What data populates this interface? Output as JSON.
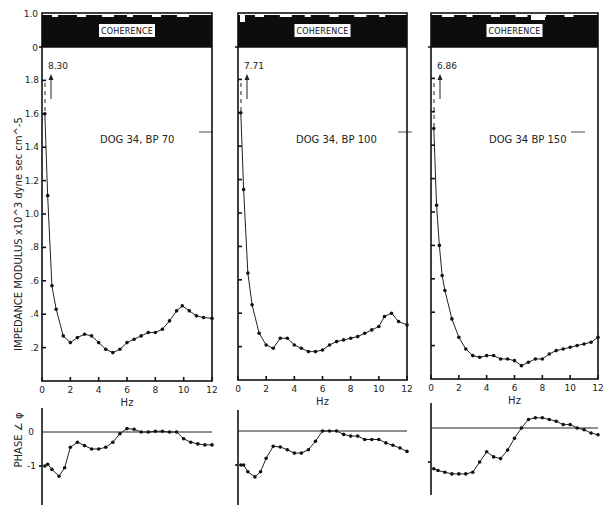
{
  "chart_data": [
    {
      "type": "line",
      "panel": "left",
      "title": "DOG 34, BP 70",
      "peak_annotation": "8.30",
      "coherence_label": "COHERENCE",
      "coherence_ticks": [
        "1.0",
        "0"
      ],
      "xlabel": "Hz",
      "ylabel": "IMPEDANCE MODULUS x10^3 dyne sec cm^-5",
      "xticks": [
        "0",
        "2",
        "4",
        "6",
        "8",
        "10",
        "12"
      ],
      "yticks": [
        ".2",
        ".4",
        ".6",
        ".8",
        "1.0",
        "1.2",
        "1.4",
        "1.6",
        "1.8"
      ],
      "xlim": [
        0,
        12
      ],
      "ylim": [
        0,
        2.0
      ],
      "impedance": {
        "x": [
          0.2,
          0.4,
          0.7,
          1.0,
          1.5,
          2.0,
          2.5,
          3.0,
          3.5,
          4.0,
          4.5,
          5.0,
          5.5,
          6.0,
          6.5,
          7.0,
          7.5,
          8.0,
          8.5,
          9.0,
          9.5,
          9.9,
          10.4,
          10.9,
          11.4,
          12.0
        ],
        "y": [
          1.6,
          1.11,
          0.57,
          0.43,
          0.27,
          0.23,
          0.26,
          0.28,
          0.27,
          0.23,
          0.19,
          0.17,
          0.19,
          0.23,
          0.25,
          0.27,
          0.29,
          0.29,
          0.31,
          0.36,
          0.42,
          0.45,
          0.42,
          0.39,
          0.38,
          0.375
        ]
      },
      "phase_ylabel": "PHASE ∠ φ",
      "phase_yticks": [
        "0",
        "-1"
      ],
      "phase": {
        "x": [
          0.2,
          0.4,
          0.7,
          1.2,
          1.6,
          2.0,
          2.5,
          3.0,
          3.5,
          4.0,
          4.5,
          5.0,
          5.5,
          6.0,
          6.5,
          7.0,
          7.5,
          8.0,
          8.5,
          9.0,
          9.5,
          10.0,
          10.5,
          11.0,
          11.5,
          12.0
        ],
        "y": [
          -1.0,
          -0.95,
          -1.1,
          -1.3,
          -1.05,
          -0.45,
          -0.3,
          -0.4,
          -0.5,
          -0.5,
          -0.45,
          -0.3,
          -0.05,
          0.1,
          0.08,
          0.0,
          0.0,
          0.02,
          0.02,
          0.0,
          0.0,
          -0.2,
          -0.3,
          -0.35,
          -0.38,
          -0.38
        ]
      }
    },
    {
      "type": "line",
      "panel": "middle",
      "title": "DOG 34, BP 100",
      "peak_annotation": "7.71",
      "coherence_label": "COHERENCE",
      "xlabel": "Hz",
      "xticks": [
        "0",
        "2",
        "4",
        "6",
        "8",
        "10",
        "12"
      ],
      "xlim": [
        0,
        12
      ],
      "ylim": [
        0,
        2.0
      ],
      "impedance": {
        "x": [
          0.2,
          0.4,
          0.7,
          1.0,
          1.5,
          2.0,
          2.5,
          3.0,
          3.5,
          4.0,
          4.5,
          5.0,
          5.5,
          6.0,
          6.5,
          7.0,
          7.5,
          8.0,
          8.5,
          9.0,
          9.5,
          10.0,
          10.4,
          10.9,
          11.4,
          12.0
        ],
        "y": [
          1.6,
          1.14,
          0.64,
          0.45,
          0.28,
          0.21,
          0.19,
          0.25,
          0.25,
          0.21,
          0.19,
          0.17,
          0.17,
          0.18,
          0.21,
          0.23,
          0.24,
          0.25,
          0.26,
          0.28,
          0.3,
          0.32,
          0.38,
          0.4,
          0.35,
          0.33
        ]
      },
      "phase": {
        "x": [
          0.2,
          0.4,
          0.7,
          1.2,
          1.6,
          2.0,
          2.5,
          3.0,
          3.5,
          4.0,
          4.5,
          5.0,
          5.5,
          6.0,
          6.5,
          7.0,
          7.5,
          8.0,
          8.5,
          9.0,
          9.5,
          10.0,
          10.5,
          11.0,
          11.5,
          12.0
        ],
        "y": [
          -1.0,
          -1.0,
          -1.2,
          -1.35,
          -1.2,
          -0.8,
          -0.45,
          -0.47,
          -0.55,
          -0.65,
          -0.65,
          -0.55,
          -0.3,
          0.0,
          0.0,
          0.0,
          -0.1,
          -0.15,
          -0.15,
          -0.25,
          -0.25,
          -0.25,
          -0.35,
          -0.42,
          -0.5,
          -0.6
        ]
      }
    },
    {
      "type": "line",
      "panel": "right",
      "title": "DOG 34 BP 150",
      "peak_annotation": "6.86",
      "coherence_label": "COHERENCE",
      "xlabel": "Hz",
      "xticks": [
        "0",
        "2",
        "4",
        "6",
        "8",
        "10",
        "12"
      ],
      "xlim": [
        0,
        12
      ],
      "ylim": [
        0,
        2.0
      ],
      "impedance": {
        "x": [
          0.2,
          0.4,
          0.6,
          0.8,
          1.0,
          1.5,
          2.0,
          2.5,
          3.0,
          3.5,
          4.0,
          4.5,
          5.0,
          5.5,
          6.0,
          6.5,
          7.0,
          7.5,
          8.0,
          8.5,
          9.0,
          9.5,
          10.0,
          10.5,
          11.0,
          11.5,
          12.0
        ],
        "y": [
          1.5,
          1.04,
          0.8,
          0.62,
          0.53,
          0.36,
          0.25,
          0.18,
          0.14,
          0.13,
          0.14,
          0.14,
          0.12,
          0.12,
          0.11,
          0.08,
          0.1,
          0.12,
          0.12,
          0.15,
          0.17,
          0.18,
          0.19,
          0.2,
          0.21,
          0.22,
          0.25
        ]
      },
      "phase": {
        "x": [
          0.2,
          0.5,
          1.0,
          1.5,
          2.0,
          2.5,
          3.0,
          3.5,
          4.0,
          4.5,
          5.0,
          5.5,
          6.0,
          6.5,
          7.0,
          7.5,
          8.0,
          8.5,
          9.0,
          9.5,
          10.0,
          10.5,
          11.0,
          11.5,
          12.0
        ],
        "y": [
          -1.2,
          -1.25,
          -1.3,
          -1.35,
          -1.35,
          -1.35,
          -1.3,
          -1.0,
          -0.7,
          -0.85,
          -0.9,
          -0.65,
          -0.3,
          0.0,
          0.25,
          0.3,
          0.3,
          0.25,
          0.2,
          0.1,
          0.1,
          0.0,
          -0.05,
          -0.15,
          -0.2
        ]
      }
    }
  ]
}
